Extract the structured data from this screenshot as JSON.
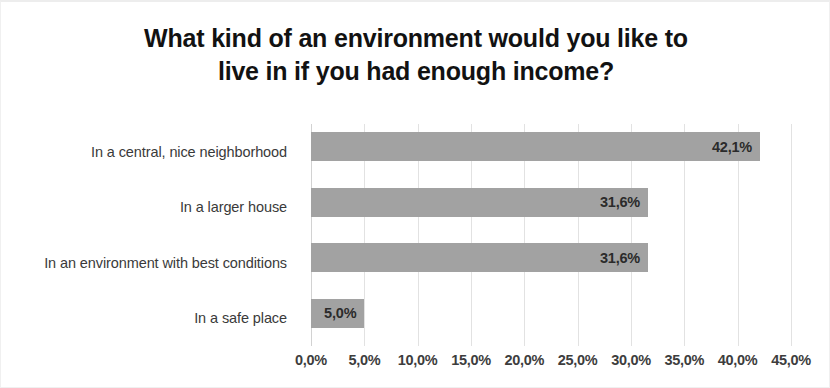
{
  "chart_data": {
    "type": "bar",
    "orientation": "horizontal",
    "title": "What kind of an environment would you like to live in if you had enough income?",
    "title_lines": [
      "What kind of an environment would you like to",
      "live in if you had enough income?"
    ],
    "xlabel": "",
    "ylabel": "",
    "categories": [
      "In a central, nice neighborhood",
      "In a larger house",
      "In an environment with best conditions",
      "In a safe place"
    ],
    "values": [
      42.1,
      31.6,
      31.6,
      5.0
    ],
    "value_labels": [
      "42,1%",
      "31,6%",
      "31,6%",
      "5,0%"
    ],
    "xlim": [
      0,
      45
    ],
    "xticks": [
      0,
      5,
      10,
      15,
      20,
      25,
      30,
      35,
      40,
      45
    ],
    "xtick_labels": [
      "0,0%",
      "5,0%",
      "10,0%",
      "15,0%",
      "20,0%",
      "25,0%",
      "30,0%",
      "35,0%",
      "40,0%",
      "45,0%"
    ],
    "grid": true,
    "grid_axis": "x",
    "legend": false,
    "bar_color": "#a2a2a2",
    "grid_color": "#e2e2e2",
    "axis_color": "#d2d2d2",
    "title_color": "#121212",
    "label_color": "#3a3a3a",
    "value_label_color": "#2b2b2b",
    "background_color": "#ffffff"
  }
}
